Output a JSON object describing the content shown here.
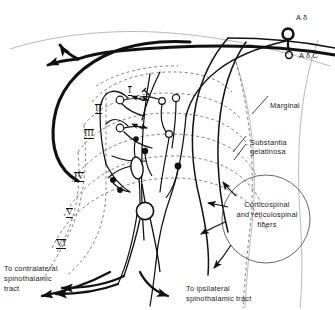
{
  "figure": {
    "domain": "Diagram",
    "background_color": "#ffffff",
    "ink_color": "#111111",
    "dashed_color": "#6e6e6e"
  },
  "labels": {
    "a_delta": "A δ",
    "a_beta_c": "A δ,C",
    "marginal": "Marginal",
    "substantia_gelatinosa_line1": "Substantia",
    "substantia_gelatinosa_line2": "gelatinosa",
    "corticospinal_line1": "Corticospinal",
    "corticospinal_line2": "and reticulospinal",
    "corticospinal_line3": "fibers",
    "contralateral_line1": "To contralateral",
    "contralateral_line2": "spinothalamic",
    "contralateral_line3": "tract",
    "ipsilateral_line1": "To ipsilateral",
    "ipsilateral_line2": "spinothalamic tract"
  },
  "laminae": [
    {
      "numeral": "I",
      "x": 128,
      "y": 86
    },
    {
      "numeral": "II",
      "x": 95,
      "y": 104
    },
    {
      "numeral": "III",
      "x": 84,
      "y": 129
    },
    {
      "numeral": "IV",
      "x": 74,
      "y": 172
    },
    {
      "numeral": "V",
      "x": 66,
      "y": 208
    },
    {
      "numeral": "VI",
      "x": 56,
      "y": 239
    }
  ],
  "elements": {
    "root_ganglion_large": "A-delta afferent terminal bulb",
    "root_ganglion_small": "A-beta/C afferent terminal bulb",
    "lissauer_tract": "bifurcating dorsolateral tract fiber",
    "interneuron_circles": 6,
    "fusiform_cell": "lamina IV projection neuron",
    "round_cell": "lamina V projection neuron",
    "bouton_terminals": 4,
    "descending_fiber_circle": "Corticospinal and reticulospinal fibers"
  }
}
